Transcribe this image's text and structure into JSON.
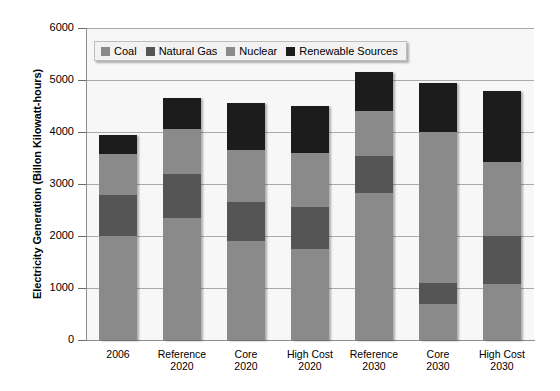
{
  "chart_data": {
    "type": "bar",
    "subtype": "stacked-bar",
    "title": "",
    "xlabel": "",
    "ylabel": "Electricity Generation (Billon Kilowatt-hours)",
    "ylim": [
      0,
      6000
    ],
    "ytick_values": [
      6000,
      5000,
      4000,
      3000,
      2000,
      1000,
      0
    ],
    "ytick_labels": [
      "6000",
      "5000",
      "4000",
      "3000",
      "2000",
      "1000",
      "0"
    ],
    "grid": true,
    "legend_position": "top-left-inside",
    "categories": [
      {
        "line1": "2006",
        "line2": ""
      },
      {
        "line1": "Reference",
        "line2": "2020"
      },
      {
        "line1": "Core",
        "line2": "2020"
      },
      {
        "line1": "High Cost",
        "line2": "2020"
      },
      {
        "line1": "Reference",
        "line2": "2030"
      },
      {
        "line1": "Core",
        "line2": "2030"
      },
      {
        "line1": "High Cost",
        "line2": "2030"
      }
    ],
    "series": [
      {
        "name": "Coal",
        "color": "#8a8a8a",
        "values": [
          2000,
          2350,
          1900,
          1750,
          2830,
          700,
          1070
        ]
      },
      {
        "name": "Natural Gas",
        "color": "#555555",
        "values": [
          780,
          850,
          750,
          800,
          700,
          400,
          930
        ]
      },
      {
        "name": "Nuclear",
        "color": "#8a8a8a",
        "values": [
          790,
          850,
          1000,
          1050,
          870,
          2900,
          1430
        ]
      },
      {
        "name": "Renewable Sources",
        "color": "#1c1c1c",
        "values": [
          380,
          600,
          900,
          900,
          750,
          950,
          1350
        ]
      }
    ],
    "totals": [
      3950,
      4650,
      4550,
      4500,
      5150,
      4950,
      4780
    ]
  },
  "legend": {
    "items": [
      {
        "label": "Coal",
        "color": "#8a8a8a"
      },
      {
        "label": "Natural Gas",
        "color": "#555555"
      },
      {
        "label": "Nuclear",
        "color": "#8a8a8a"
      },
      {
        "label": "Renewable Sources",
        "color": "#1c1c1c"
      }
    ]
  }
}
